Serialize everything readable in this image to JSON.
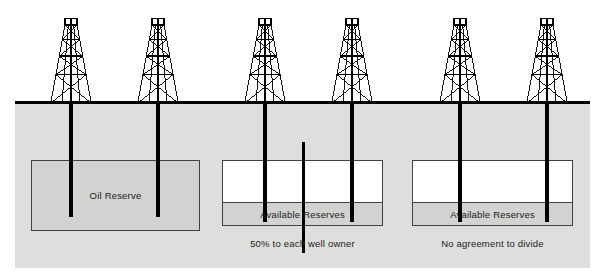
{
  "diagram": {
    "colors": {
      "ground": "#dededd",
      "reserve_fill": "#d2d2d1",
      "empty_fill": "#ffffff",
      "line": "#000000",
      "box_border": "#414141",
      "text": "#1c1c1c"
    },
    "ground_line_y": 103,
    "wells": [
      {
        "id": "well-1",
        "x": 71,
        "group": "left"
      },
      {
        "id": "well-2",
        "x": 158,
        "group": "left"
      },
      {
        "id": "well-3",
        "x": 265,
        "group": "middle"
      },
      {
        "id": "well-4",
        "x": 352,
        "group": "middle"
      },
      {
        "id": "well-5",
        "x": 460,
        "group": "right"
      },
      {
        "id": "well-6",
        "x": 547,
        "group": "right"
      }
    ],
    "panels": [
      {
        "id": "left",
        "box_label": "Oil Reserve",
        "caption": "",
        "box": {
          "x": 31,
          "y": 160,
          "w": 169,
          "h": 71
        },
        "band": null,
        "divider": false,
        "fill": "filled"
      },
      {
        "id": "middle",
        "box_label": "Available Reserves",
        "caption": "50% to each well owner",
        "box": {
          "x": 222,
          "y": 160,
          "w": 161,
          "h": 43
        },
        "band": {
          "x": 222,
          "y": 203,
          "w": 161,
          "h": 23
        },
        "divider": true,
        "fill": "empty"
      },
      {
        "id": "right",
        "box_label": "Available Reserves",
        "caption": "No agreement to divide",
        "box": {
          "x": 412,
          "y": 160,
          "w": 161,
          "h": 43
        },
        "band": {
          "x": 412,
          "y": 203,
          "w": 161,
          "h": 23
        },
        "divider": false,
        "fill": "empty"
      }
    ],
    "center_divider": {
      "x": 303,
      "top": 142,
      "bottom": 253
    }
  }
}
